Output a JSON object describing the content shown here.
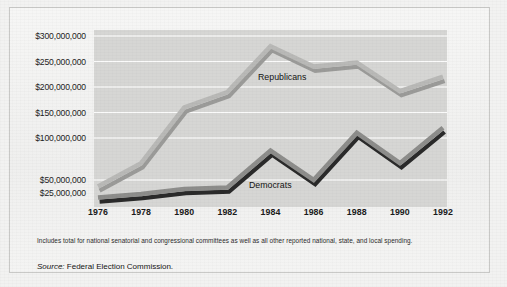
{
  "figure": {
    "footnote": "Includes total for national senatorial and congressional committees as well as all other reported national, state, and local spending.",
    "source_label": "Source:",
    "source_text": " Federal Election Commission."
  },
  "chart_data": {
    "type": "line",
    "title": "",
    "xlabel": "",
    "ylabel": "",
    "grid": true,
    "legend": "inline-annotation",
    "categories": [
      "1976",
      "1978",
      "1980",
      "1982",
      "1984",
      "1986",
      "1988",
      "1990",
      "1992"
    ],
    "x": [
      1976,
      1978,
      1980,
      1982,
      1984,
      1986,
      1988,
      1990,
      1992
    ],
    "ytick_labels": [
      "$300,000,000",
      "$250,000,000",
      "$200,000,000",
      "$150,000,000",
      "$100,000,000",
      "$50,000,000",
      "$25,000,000"
    ],
    "ytick_values": [
      300000000,
      250000000,
      200000000,
      150000000,
      100000000,
      50000000,
      25000000
    ],
    "ylim": [
      0,
      300000000
    ],
    "series": [
      {
        "name": "Republicans",
        "color": "#b9b9b7",
        "shadow_color": "#9b9b99",
        "values": [
          37000000,
          70000000,
          160000000,
          190000000,
          280000000,
          240000000,
          248000000,
          192000000,
          220000000
        ]
      },
      {
        "name": "Democrats",
        "color": "#8d8d8b",
        "shadow_color": "#2a2a2a",
        "values": [
          15000000,
          22000000,
          32000000,
          35000000,
          85000000,
          50000000,
          110000000,
          70000000,
          120000000
        ]
      }
    ],
    "annotations": [
      {
        "text": "Republicans",
        "x": 1984,
        "y": 228000000
      },
      {
        "text": "Democrats",
        "x": 1985,
        "y": 38000000
      }
    ],
    "plot_background": "#d6d6d4",
    "gridline_color": "#ffffff"
  }
}
